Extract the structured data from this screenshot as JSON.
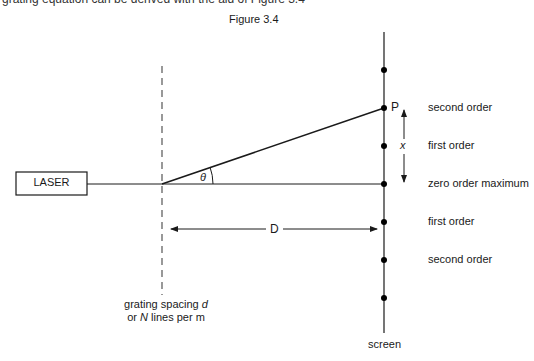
{
  "cropped_top_text": "grating equation can be derived with the aid of Figure 3.4",
  "figure_title": "Figure 3.4",
  "laser": {
    "label": "LASER"
  },
  "angle_label": "θ",
  "point_label": "P",
  "distance_label": "D",
  "separation_label": "x",
  "grating": {
    "line1_prefix": "grating spacing ",
    "line1_var": "d",
    "line2_prefix": "or ",
    "line2_var": "N",
    "line2_suffix": " lines per m"
  },
  "screen_label": "screen",
  "orders": [
    {
      "label": "second order",
      "y": 108
    },
    {
      "label": "first order",
      "y": 146
    },
    {
      "label": "zero order maximum",
      "y": 184
    },
    {
      "label": "first order",
      "y": 222
    },
    {
      "label": "second order",
      "y": 260
    }
  ],
  "colors": {
    "line": "#1a1a1a",
    "dashed": "#555555",
    "background": "#ffffff"
  }
}
